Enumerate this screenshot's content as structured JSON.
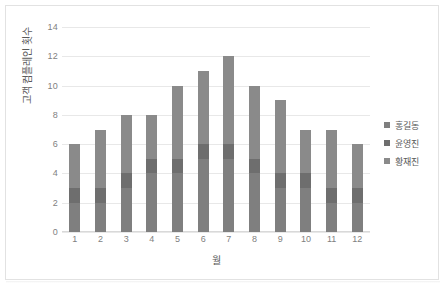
{
  "chart_data": {
    "type": "bar",
    "stacked": true,
    "title": "",
    "xlabel": "월",
    "ylabel": "고객 컴플레인 횟수",
    "categories": [
      "1",
      "2",
      "3",
      "4",
      "5",
      "6",
      "7",
      "8",
      "9",
      "10",
      "11",
      "12"
    ],
    "yticks": [
      "14",
      "12",
      "10",
      "8",
      "6",
      "4",
      "2",
      "0"
    ],
    "ylim": [
      0,
      14
    ],
    "grid": true,
    "legend_position": "right",
    "series": [
      {
        "name": "홍길동",
        "color": "#7f7f7f",
        "values": [
          2,
          2,
          3,
          4,
          4,
          5,
          5,
          4,
          3,
          3,
          2,
          2
        ]
      },
      {
        "name": "윤영진",
        "color": "#6e6e6e",
        "values": [
          1,
          1,
          1,
          1,
          1,
          1,
          1,
          1,
          1,
          1,
          1,
          1
        ]
      },
      {
        "name": "황재진",
        "color": "#8a8a8a",
        "values": [
          3,
          4,
          4,
          3,
          5,
          5,
          6,
          5,
          5,
          3,
          4,
          3
        ]
      }
    ],
    "totals": [
      6,
      7,
      8,
      8,
      10,
      11,
      12,
      10,
      9,
      7,
      7,
      6
    ]
  },
  "legend": {
    "items": [
      {
        "label": "홍길동"
      },
      {
        "label": "윤영진"
      },
      {
        "label": "황재진"
      }
    ]
  },
  "colors": {
    "bar_primary": "#7f7f7f",
    "bar_secondary": "#6e6e6e",
    "bar_tertiary": "#8a8a8a",
    "gridline": "#e8e8e8",
    "tick_text": "#7f7f7f",
    "axis_title": "#595959",
    "frame_border": "#e2e2e2",
    "background": "#ffffff"
  }
}
